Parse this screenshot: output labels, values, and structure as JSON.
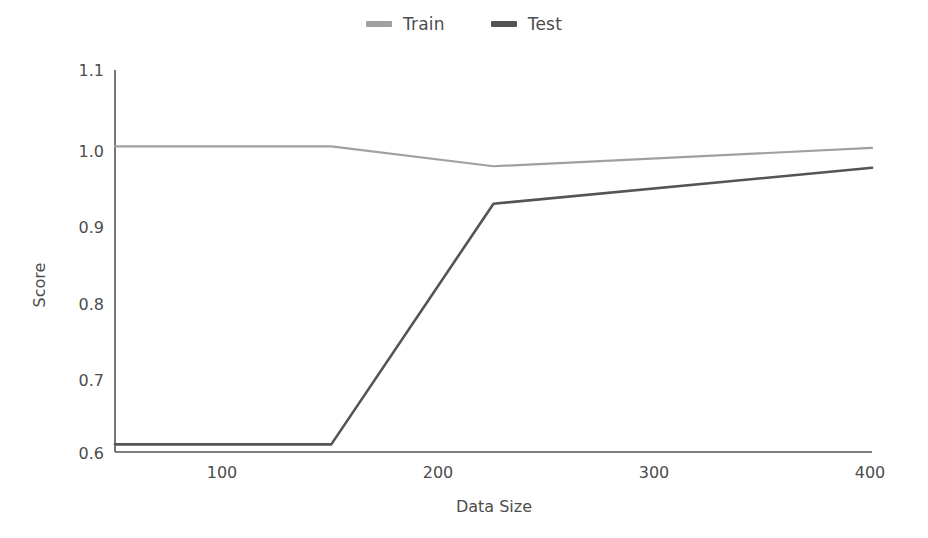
{
  "chart_data": {
    "type": "line",
    "title": "",
    "xlabel": "Data Size",
    "ylabel": "Score",
    "xlim": [
      50,
      400
    ],
    "ylim": [
      0.6,
      1.1
    ],
    "xticks": [
      100,
      200,
      300,
      400
    ],
    "yticks": [
      "0.6",
      "0.7",
      "0.8",
      "0.9",
      "1.0",
      "1.1"
    ],
    "grid": false,
    "legend_position": "top-center",
    "series": [
      {
        "name": "Train",
        "color": "#a0a0a0",
        "x": [
          50,
          150,
          225,
          400
        ],
        "values": [
          1.0,
          1.0,
          0.974,
          0.998
        ]
      },
      {
        "name": "Test",
        "color": "#545454",
        "x": [
          50,
          150,
          225,
          400
        ],
        "values": [
          0.61,
          0.61,
          0.925,
          0.972
        ]
      }
    ]
  },
  "legend": {
    "entries": [
      {
        "label": "Train",
        "marker": "line-swatch-train"
      },
      {
        "label": "Test",
        "marker": "line-swatch-test"
      }
    ]
  },
  "axes": {
    "x": {
      "title": "Data Size",
      "ticks": [
        "100",
        "200",
        "300",
        "400"
      ]
    },
    "y": {
      "title": "Score",
      "ticks": [
        "1.1",
        "1.0",
        "0.9",
        "0.8",
        "0.7",
        "0.6"
      ]
    }
  },
  "colors": {
    "train": "#a0a0a0",
    "test": "#545454",
    "axis": "#555555",
    "text": "#4d4d4d",
    "background": "#ffffff"
  }
}
